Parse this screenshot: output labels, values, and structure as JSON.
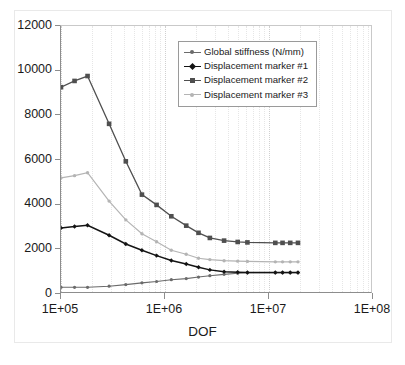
{
  "chart_data": {
    "type": "line",
    "title": "",
    "xlabel": "DOF",
    "ylabel": "",
    "xscale": "log",
    "xlim": [
      100000,
      100000000
    ],
    "ylim": [
      0,
      12000
    ],
    "grid": "minor-vertical-only",
    "legend_position": "upper-right-inside",
    "xtick_labels": [
      "1E+05",
      "1E+06",
      "1E+07",
      "1E+08"
    ],
    "xtick_values": [
      100000,
      1000000,
      10000000,
      100000000
    ],
    "ytick_labels": [
      "0",
      "2000",
      "4000",
      "6000",
      "8000",
      "10000",
      "12000"
    ],
    "ytick_values": [
      0,
      2000,
      4000,
      6000,
      8000,
      10000,
      12000
    ],
    "series": [
      {
        "name": "Global stiffness (N/mm)",
        "color": "#6b6b6b",
        "marker": "dot",
        "marker_size": 3.2,
        "line_width": 1.1,
        "x": [
          100000,
          135000,
          180000,
          290000,
          420000,
          600000,
          830000,
          1150000,
          1600000,
          2100000,
          2700000,
          3700000,
          5000000,
          6200000,
          11500000,
          13500000,
          16000000,
          19000000
        ],
        "y": [
          300,
          300,
          300,
          350,
          420,
          500,
          560,
          640,
          690,
          760,
          820,
          880,
          930,
          950,
          950,
          950,
          950,
          950
        ]
      },
      {
        "name": "Displacement marker #1 (µm)",
        "color": "#141414",
        "marker": "diamond",
        "marker_size": 4.4,
        "line_width": 1.5,
        "x": [
          100000,
          135000,
          180000,
          290000,
          420000,
          600000,
          830000,
          1150000,
          1600000,
          2100000,
          2700000,
          3700000,
          5000000,
          6200000,
          11500000,
          13500000,
          16000000,
          19000000
        ],
        "y": [
          2960,
          3020,
          3080,
          2630,
          2240,
          1960,
          1720,
          1500,
          1340,
          1200,
          1080,
          1000,
          975,
          960,
          960,
          960,
          960,
          960
        ]
      },
      {
        "name": "Displacement marker #2 (µm)",
        "color": "#4f4f4f",
        "marker": "square",
        "marker_size": 4.6,
        "line_width": 1.3,
        "x": [
          100000,
          135000,
          180000,
          290000,
          420000,
          600000,
          830000,
          1150000,
          1600000,
          2100000,
          2700000,
          3700000,
          5000000,
          6200000,
          11500000,
          13500000,
          16000000,
          19000000
        ],
        "y": [
          9260,
          9540,
          9760,
          7620,
          5940,
          4450,
          3990,
          3480,
          3060,
          2740,
          2510,
          2390,
          2330,
          2310,
          2290,
          2290,
          2290,
          2290
        ]
      },
      {
        "name": "Displacement marker #3 (µm)",
        "color": "#b4b4b4",
        "marker": "dot",
        "marker_size": 3.4,
        "line_width": 1.2,
        "x": [
          100000,
          135000,
          180000,
          290000,
          420000,
          600000,
          830000,
          1150000,
          1600000,
          2100000,
          2700000,
          3700000,
          5000000,
          6200000,
          11500000,
          13500000,
          16000000,
          19000000
        ],
        "y": [
          5200,
          5300,
          5430,
          4160,
          3320,
          2700,
          2340,
          1960,
          1780,
          1600,
          1540,
          1490,
          1470,
          1460,
          1440,
          1440,
          1440,
          1440
        ]
      }
    ]
  }
}
